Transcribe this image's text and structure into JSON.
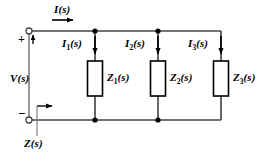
{
  "figure": {
    "kind": "electrical-circuit-diagram",
    "background_color": "#ffffff",
    "wire_color": "#000000",
    "label_color": "#000000"
  },
  "labels": {
    "total_current": "I(s)",
    "branch_current_1_main": "I",
    "branch_current_1_sub": "1",
    "branch_current_1_tail": "(s)",
    "branch_current_2_main": "I",
    "branch_current_2_sub": "2",
    "branch_current_2_tail": "(s)",
    "branch_current_3_main": "I",
    "branch_current_3_sub": "3",
    "branch_current_3_tail": "(s)",
    "source_voltage_main": "V",
    "source_voltage_tail": "(s)",
    "impedance_1_main": "Z",
    "impedance_1_sub": "1",
    "impedance_1_tail": "(s)",
    "impedance_2_main": "Z",
    "impedance_2_sub": "2",
    "impedance_2_tail": "(s)",
    "impedance_3_main": "Z",
    "impedance_3_sub": "3",
    "impedance_3_tail": "(s)",
    "equivalent_impedance_main": "Z",
    "equivalent_impedance_tail": "(s)",
    "plus_terminal": "+",
    "minus_terminal": "−"
  },
  "icons": {
    "current_arrow_total": "arrow-right-icon",
    "current_arrow_branch_1": "arrow-down-icon",
    "current_arrow_branch_2": "arrow-down-icon",
    "current_arrow_branch_3": "arrow-down-icon",
    "voltage_arrow": "arrow-up-icon",
    "impedance_arrow": "arrow-right-icon",
    "terminal_top": "open-terminal-icon",
    "terminal_bottom": "open-terminal-icon"
  },
  "geometry": {
    "top_rail_y": 31,
    "bottom_rail_y": 120,
    "terminal_x": 29,
    "node_1_x": 95,
    "node_2_x": 158,
    "node_3_x": 221,
    "block_width": 15,
    "block_top_y": 61,
    "block_bottom_y": 96
  }
}
